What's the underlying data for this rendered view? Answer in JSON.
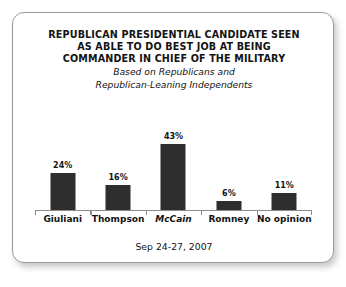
{
  "card": {
    "border_color": "#9a9a9a",
    "background": "#ffffff"
  },
  "title": {
    "lines": [
      "REPUBLICAN PRESIDENTIAL CANDIDATE SEEN",
      "AS ABLE TO DO BEST JOB AT BEING",
      "COMMANDER IN CHIEF OF THE MILITARY"
    ]
  },
  "subtitle": {
    "lines": [
      "Based on Republicans and",
      "Republican-Leaning Independents"
    ]
  },
  "footer": {
    "date_range": "Sep 24-27, 2007"
  },
  "chart_data": {
    "type": "bar",
    "title": "REPUBLICAN PRESIDENTIAL CANDIDATE SEEN AS ABLE TO DO BEST JOB AT BEING COMMANDER IN CHIEF OF THE MILITARY",
    "subtitle": "Based on Republicans and Republican-Leaning Independents",
    "categories": [
      "Giuliani",
      "Thompson",
      "McCain",
      "Romney",
      "No opinion"
    ],
    "values": [
      24,
      16,
      43,
      6,
      11
    ],
    "value_labels": [
      "24%",
      "16%",
      "43%",
      "6%",
      "11%"
    ],
    "xlabel": "",
    "ylabel": "",
    "ylim": [
      0,
      50
    ],
    "grid": false,
    "legend": "none",
    "bar_color": "#2e2e2e",
    "axis_color": "#8d8d8d",
    "note": "Sep 24-27, 2007"
  }
}
